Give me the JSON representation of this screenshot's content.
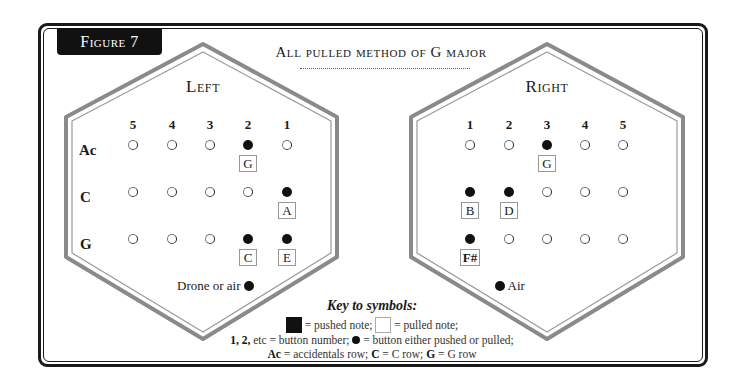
{
  "figure": {
    "tab_label": "Figure 7",
    "title": "All pulled method of G major"
  },
  "left": {
    "label": "Left",
    "columns": [
      "5",
      "4",
      "3",
      "2",
      "1"
    ],
    "rows": [
      {
        "label": "Ac",
        "buttons": [
          {
            "state": "open"
          },
          {
            "state": "open"
          },
          {
            "state": "open"
          },
          {
            "state": "filled",
            "note": "G"
          },
          {
            "state": "open"
          }
        ]
      },
      {
        "label": "C",
        "buttons": [
          {
            "state": "open"
          },
          {
            "state": "open"
          },
          {
            "state": "open"
          },
          {
            "state": "open"
          },
          {
            "state": "filled",
            "note": "A"
          }
        ]
      },
      {
        "label": "G",
        "buttons": [
          {
            "state": "open"
          },
          {
            "state": "open"
          },
          {
            "state": "open"
          },
          {
            "state": "filled",
            "note": "C"
          },
          {
            "state": "filled",
            "note": "E"
          }
        ]
      }
    ],
    "extra_label": "Drone or air"
  },
  "right": {
    "label": "Right",
    "columns": [
      "1",
      "2",
      "3",
      "4",
      "5"
    ],
    "rows": [
      {
        "buttons": [
          {
            "state": "open"
          },
          {
            "state": "open"
          },
          {
            "state": "filled",
            "note": "G"
          },
          {
            "state": "open"
          },
          {
            "state": "open"
          }
        ]
      },
      {
        "buttons": [
          {
            "state": "filled",
            "note": "B"
          },
          {
            "state": "filled",
            "note": "D"
          },
          {
            "state": "open"
          },
          {
            "state": "open"
          },
          {
            "state": "open"
          }
        ]
      },
      {
        "buttons": [
          {
            "state": "filled",
            "note": "F#"
          },
          {
            "state": "open"
          },
          {
            "state": "open"
          },
          {
            "state": "open"
          },
          {
            "state": "open"
          }
        ]
      }
    ],
    "extra_label": "Air"
  },
  "key": {
    "title": "Key to symbols:",
    "pushed_text": "= pushed note;",
    "pulled_text": "= pulled note;",
    "button_number_bold": "1, 2,",
    "button_number_text": "etc = button number;",
    "either_text": "= button either pushed or pulled;",
    "ac_bold": "Ac",
    "ac_text": "= accidentals row;",
    "c_bold": "C",
    "c_text": "= C row;",
    "g_bold": "G",
    "g_text": "= G row"
  },
  "colors": {
    "frame": "#1a1a1a",
    "hex_outline": "#8a8a8a",
    "tab_bg": "#111111"
  }
}
